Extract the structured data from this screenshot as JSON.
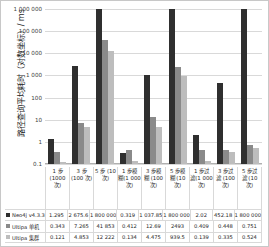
{
  "chart_data": {
    "type": "bar",
    "title": "",
    "xlabel": "",
    "ylabel": "路径查询平均耗时（对数坐标）/ ms",
    "yscale": "log",
    "ylim": [
      0.1,
      1000000
    ],
    "yticks": [
      "0.1",
      "1",
      "10",
      "100",
      "1 000",
      "10 000",
      "100 000",
      "1 000 000"
    ],
    "ytick_values": [
      0.1,
      1,
      10,
      100,
      1000,
      10000,
      100000,
      1000000
    ],
    "grid": true,
    "legend_position": "table-left",
    "categories": [
      "1 步\n(1000\n次)",
      "3 步\n(100 次)",
      "5 步 (10\n次)",
      "1 步模\n糊(1 000\n次)",
      "3 步模\n糊 (100\n次)",
      "5 步模\n糊 (10\n次)",
      "1 步过\n滤(1 000\n次)",
      "3 步过\n滤 (100\n次)",
      "5 步过\n滤 (10\n次)"
    ],
    "series": [
      {
        "name": "Neo4j v4.3.3",
        "color": "#2f2f2f",
        "values": [
          1.295,
          2675.6,
          1800000,
          0.319,
          1037.85,
          1800000,
          2.02,
          452.18,
          1800000
        ],
        "labels": [
          "1.295",
          "2 675.6",
          "1 800 000",
          "0.319",
          "1 037.85",
          "1 800 000",
          "2.02",
          "452.18",
          "1 800 000"
        ]
      },
      {
        "name": "Ultipa 单机",
        "color": "#8a8a8a",
        "values": [
          0.343,
          7.265,
          41853,
          0.412,
          12.69,
          2493,
          0.409,
          0.448,
          0.751
        ],
        "labels": [
          "0.343",
          "7.265",
          "41 853",
          "0.412",
          "12.69",
          "2493",
          "0.409",
          "0.448",
          "0.751"
        ]
      },
      {
        "name": "Ultipa 集群",
        "color": "#bdbdbd",
        "values": [
          0.121,
          4.853,
          12222,
          0.134,
          4.475,
          939.5,
          0.139,
          0.335,
          0.524
        ],
        "labels": [
          "0.121",
          "4.853",
          "12 222",
          "0.134",
          "4.475",
          "939.5",
          "0.139",
          "0.335",
          "0.524"
        ]
      }
    ]
  }
}
